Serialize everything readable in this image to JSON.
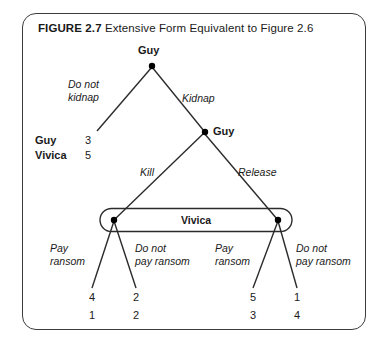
{
  "figure": {
    "number_label": "FIGURE 2.7",
    "caption": "Extensive Form Equivalent to Figure 2.6"
  },
  "diagram": {
    "type": "game-tree-extensive-form",
    "root_player": "Guy",
    "second_player": "Guy",
    "information_set_player": "Vivica",
    "nodes": [
      {
        "id": "root",
        "label": "Guy",
        "x": 152,
        "y": 65
      },
      {
        "id": "guy2",
        "label": "Guy",
        "x": 205,
        "y": 132
      },
      {
        "id": "vivica_left",
        "label": "",
        "x": 114,
        "y": 220
      },
      {
        "id": "vivica_right",
        "label": "",
        "x": 278,
        "y": 220
      }
    ],
    "actions": {
      "do_not_kidnap": "Do not\nkidnap",
      "do_not_kidnap_line1": "Do not",
      "do_not_kidnap_line2": "kidnap",
      "kidnap": "Kidnap",
      "kill": "Kill",
      "release": "Release",
      "pay_ransom_line1": "Pay",
      "pay_ransom_line2": "ransom",
      "do_not_pay_line1": "Do not",
      "do_not_pay_line2": "pay ransom"
    },
    "payoff_legend": {
      "player1": "Guy",
      "player2": "Vivica",
      "player1_value": "3",
      "player2_value": "5"
    },
    "terminal_payoffs": [
      {
        "id": "t1",
        "guy": "4",
        "vivica": "1",
        "x": 92
      },
      {
        "id": "t2",
        "guy": "2",
        "vivica": "2",
        "x": 136
      },
      {
        "id": "t3",
        "guy": "5",
        "vivica": "3",
        "x": 253
      },
      {
        "id": "t4",
        "guy": "1",
        "vivica": "4",
        "x": 297
      }
    ],
    "colors": {
      "frame": "#3c3c3c",
      "line": "#2b2b2b",
      "node": "#000000",
      "text": "#1a1a1a"
    }
  }
}
